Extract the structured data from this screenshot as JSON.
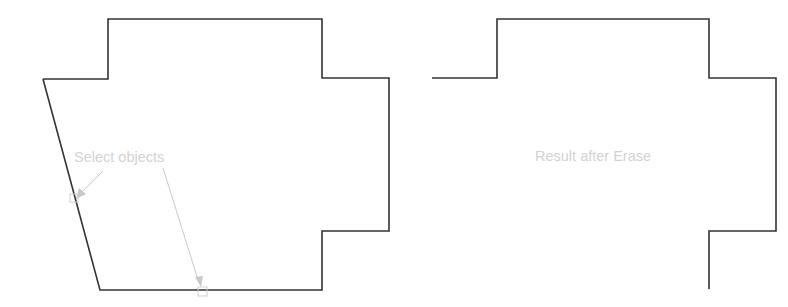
{
  "figure": {
    "left_panel": {
      "label": "Select objects",
      "outline_color": "#333333",
      "annotation_color": "#c8c8c8"
    },
    "right_panel": {
      "label": "Result after Erase",
      "outline_color": "#333333"
    }
  }
}
